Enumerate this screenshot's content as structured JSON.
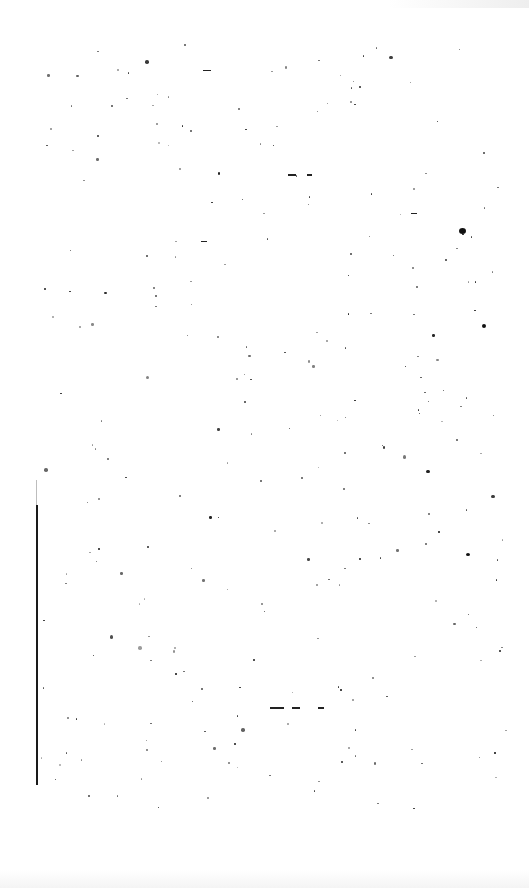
{
  "page": {
    "type": "blank scanned page",
    "text": "",
    "artifacts": {
      "gutter_line": {
        "x": 36,
        "y_start": 505,
        "y_end": 785,
        "faint_start": 480,
        "color": "#1a1a1a"
      },
      "noise_color": "#111111",
      "background": "#ffffff"
    }
  }
}
